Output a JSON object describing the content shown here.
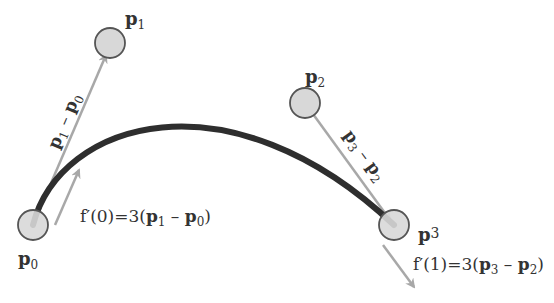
{
  "diagram": {
    "points": [
      {
        "id": "p0",
        "label": "p",
        "sub": "0",
        "x": 33,
        "y": 225
      },
      {
        "id": "p1",
        "label": "p",
        "sub": "1",
        "x": 110,
        "y": 43
      },
      {
        "id": "p2",
        "label": "p",
        "sub": "2",
        "x": 305,
        "y": 103
      },
      {
        "id": "p3",
        "label": "p",
        "sup": "3",
        "x": 394,
        "y": 225
      }
    ],
    "vector_labels": {
      "p1_minus_p0": {
        "a": "p",
        "a_sub": "1",
        "op": " – ",
        "b": "p",
        "b_sub": "0"
      },
      "p3_minus_p2": {
        "a": "p",
        "a_sub": "3",
        "op": " – ",
        "b": "p",
        "b_sub": "2"
      }
    },
    "equations": {
      "f0": {
        "prefix": "f′(0)=3(",
        "a": "p",
        "a_sub": "1",
        "op": " – ",
        "b": "p",
        "b_sub": "0",
        "suffix": ")"
      },
      "f1": {
        "prefix": "f′(1)=3(",
        "a": "p",
        "a_sub": "3",
        "op": " – ",
        "b": "p",
        "b_sub": "2",
        "suffix": ")"
      }
    },
    "colors": {
      "curve": "#2e2e2e",
      "arrow": "#a8a8a8",
      "point_fill": "#d8d8d8",
      "point_stroke": "#555555",
      "text": "#333333"
    }
  }
}
